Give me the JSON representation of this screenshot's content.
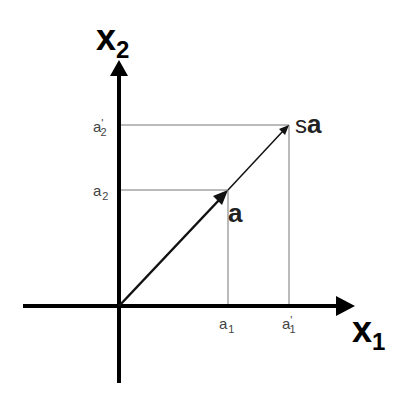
{
  "diagram": {
    "axes": {
      "x": {
        "label": "x",
        "subscript": "1"
      },
      "y": {
        "label": "x",
        "subscript": "2"
      }
    },
    "vectors": [
      {
        "name": "a",
        "label": "a",
        "bold": true
      },
      {
        "name": "sa",
        "label_prefix": "s",
        "label_main": "a"
      }
    ],
    "ticks": {
      "x": [
        {
          "base": "a",
          "prime": "",
          "sub": "1"
        },
        {
          "base": "a",
          "prime": "'",
          "sub": "1"
        }
      ],
      "y": [
        {
          "base": "a",
          "prime": "",
          "sub": "2"
        },
        {
          "base": "a",
          "prime": "'",
          "sub": "2"
        }
      ]
    },
    "colors": {
      "axis": "#000000",
      "guide": "#666666",
      "vector": "#111111"
    }
  }
}
